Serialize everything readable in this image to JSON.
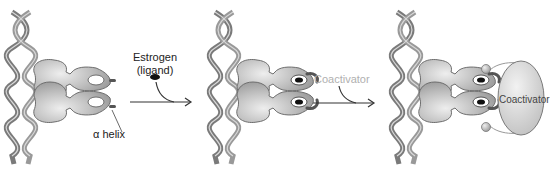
{
  "diagram": {
    "type": "estrogen-receptor-activation",
    "panels": [
      {
        "id": "unbound",
        "dna_label": "",
        "receptor_state": "no ligand",
        "labels": {
          "helix": "α helix"
        }
      },
      {
        "id": "ligand-bound",
        "receptor_state": "estrogen bound, helix repositioned"
      },
      {
        "id": "coactivator-bound",
        "receptor_state": "coactivator recruited",
        "labels": {
          "coactivator_body": "Coactivator"
        }
      }
    ],
    "steps": [
      {
        "id": "step-1",
        "label_line1": "Estrogen",
        "label_line2": "(ligand)"
      },
      {
        "id": "step-2",
        "label": "Coactivator"
      }
    ],
    "colors": {
      "dna": "#7a7a7a",
      "receptor": "#b9b9b9",
      "receptor_outline": "#6e6e6e",
      "ligand": "#111111",
      "coactivator": "#d4d4d4",
      "coactivator_label_step": "#b0b0b0",
      "arrow": "#333333"
    }
  }
}
